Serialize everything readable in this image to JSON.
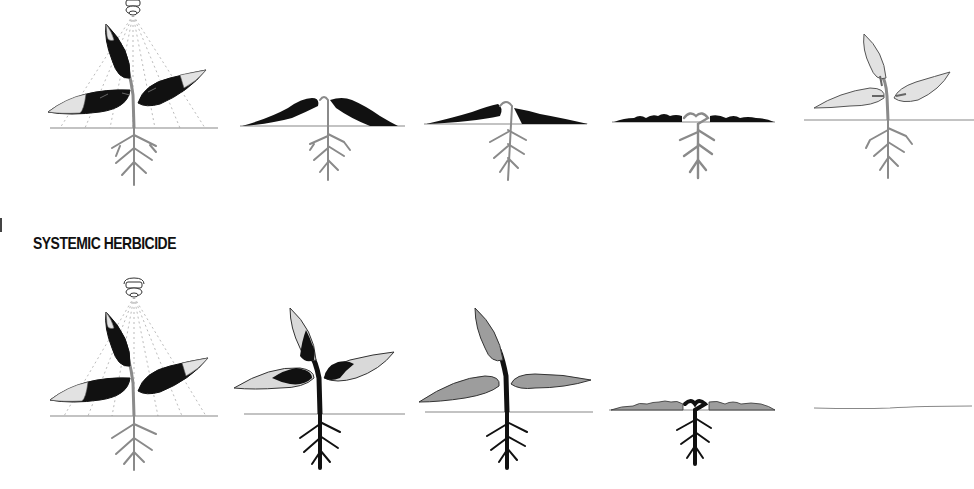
{
  "sections": [
    {
      "id": "contact",
      "title": "",
      "stages": [
        {
          "label": "spray-application",
          "leaf_state": "sprayed-dark",
          "root_state": "gray"
        },
        {
          "label": "leaves-collapsing",
          "leaf_state": "wilted-dark",
          "root_state": "gray"
        },
        {
          "label": "leaves-flattened",
          "leaf_state": "flat-dark",
          "root_state": "gray"
        },
        {
          "label": "leaves-shriveled",
          "leaf_state": "shriveled-dark",
          "root_state": "gray"
        },
        {
          "label": "regrowth",
          "leaf_state": "new-light",
          "root_state": "gray"
        }
      ]
    },
    {
      "id": "systemic",
      "title": "SYSTEMIC HERBICIDE",
      "stages": [
        {
          "label": "spray-application",
          "leaf_state": "sprayed-dark",
          "root_state": "gray"
        },
        {
          "label": "translocation",
          "leaf_state": "light-with-dark-patches",
          "root_state": "dark"
        },
        {
          "label": "whole-plant-affected",
          "leaf_state": "gray",
          "root_state": "dark"
        },
        {
          "label": "collapse",
          "leaf_state": "shriveled-gray",
          "root_state": "dark"
        },
        {
          "label": "plant-dead",
          "leaf_state": "none",
          "root_state": "none"
        }
      ]
    }
  ],
  "colors": {
    "ink": "#111111",
    "stem_gray": "#9a9a9a",
    "leaf_light": "#d9d9d9",
    "leaf_mid": "#9d9d9d",
    "ground": "#888888",
    "background": "#ffffff"
  }
}
